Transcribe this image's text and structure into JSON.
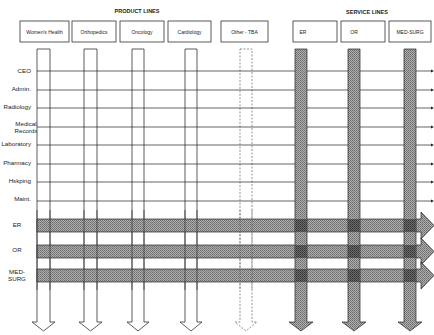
{
  "diagram": {
    "product_lines_title": "PRODUCT LINES",
    "service_lines_title": "SERVICE LINES",
    "product_lines": [
      {
        "label": "Women's Health",
        "style": "outline"
      },
      {
        "label": "Orthopedics",
        "style": "outline"
      },
      {
        "label": "Oncology",
        "style": "outline"
      },
      {
        "label": "Cardiology",
        "style": "outline"
      },
      {
        "label": "Other - TBA",
        "style": "dashed"
      }
    ],
    "service_lines": [
      {
        "label": "ER",
        "style": "shaded"
      },
      {
        "label": "OR",
        "style": "shaded"
      },
      {
        "label": "MED-SURG",
        "style": "shaded"
      }
    ],
    "functional_rows": [
      {
        "label": "CEO"
      },
      {
        "label": "Admin."
      },
      {
        "label": "Radiology"
      },
      {
        "label": "Medical Records",
        "line1": "Medical",
        "line2": "Records"
      },
      {
        "label": "Laboratory"
      },
      {
        "label": "Pharmacy"
      },
      {
        "label": "Hskping"
      },
      {
        "label": "Maint."
      }
    ],
    "service_rows": [
      {
        "label": "ER"
      },
      {
        "label": "OR"
      },
      {
        "label": "MED-SURG",
        "line1": "MED-",
        "line2": "SURG"
      }
    ],
    "colors": {
      "line": "#1a1a1a",
      "shade": "#9a9a9a",
      "shade_dark": "#6e6e6e",
      "background": "#ffffff"
    }
  }
}
